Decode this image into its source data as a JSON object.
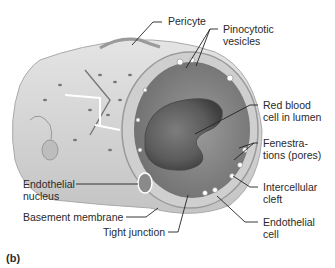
{
  "figure": {
    "panel_label": "(b)",
    "labels": {
      "pericyte": "Pericyte",
      "pinocytotic_vesicles_1": "Pinocytotic",
      "pinocytotic_vesicles_2": "vesicles",
      "red_blood_cell_1": "Red blood",
      "red_blood_cell_2": "cell in lumen",
      "fenestrations_1": "Fenestra-",
      "fenestrations_2": "tions (pores)",
      "intercellular_cleft_1": "Intercellular",
      "intercellular_cleft_2": "cleft",
      "endothelial_cell_1": "Endothelial",
      "endothelial_cell_2": "cell",
      "endothelial_nucleus_1": "Endothelial",
      "endothelial_nucleus_2": "nucleus",
      "basement_membrane": "Basement membrane",
      "tight_junction": "Tight junction"
    },
    "colors": {
      "tissue_light": "#d9d9d9",
      "tissue_mid": "#b5b5b5",
      "lumen": "#8c8c8c",
      "rbc": "#6a6a6a",
      "leader": "#222222"
    }
  }
}
